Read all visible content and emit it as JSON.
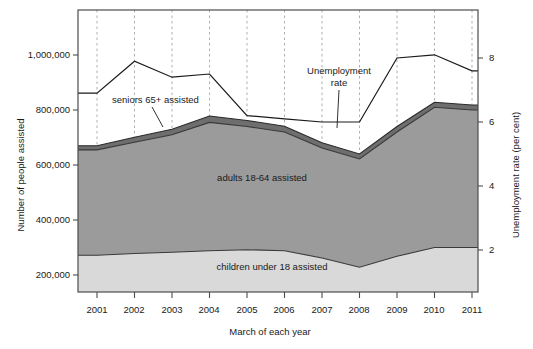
{
  "chart_data": {
    "type": "area",
    "title": "",
    "subtitle": "",
    "xlabel": "March of each year",
    "ylabel": "Number of people assisted",
    "y2label": "Unemployment rate (per cent)",
    "x": [
      2001,
      2002,
      2003,
      2004,
      2005,
      2006,
      2007,
      2008,
      2009,
      2010,
      2011
    ],
    "categories": [
      "2001",
      "2002",
      "2003",
      "2004",
      "2005",
      "2006",
      "2007",
      "2008",
      "2009",
      "2010",
      "2011"
    ],
    "xlim": [
      2000.5,
      2011.5
    ],
    "ylim": [
      0,
      1100000
    ],
    "y2lim": [
      0,
      8.8
    ],
    "yticks": [
      200000,
      400000,
      600000,
      800000,
      1000000
    ],
    "ytick_labels": [
      "200,000",
      "400,000",
      "600,000",
      "800,000",
      "1,000,000"
    ],
    "y2ticks": [
      2,
      4,
      6,
      8
    ],
    "y2tick_labels": [
      "2",
      "4",
      "6",
      "8"
    ],
    "grid": "vertical-dashed",
    "legend_position": "inline-annotations",
    "stacked": true,
    "series": [
      {
        "name": "children under 18 assisted",
        "axis": "left",
        "color": "#d9d9d9",
        "values": [
          272000,
          278000,
          283000,
          288000,
          292000,
          288000,
          262000,
          228000,
          268000,
          300000,
          300000
        ]
      },
      {
        "name": "adults 18-64 assisted",
        "axis": "left",
        "color": "#9b9b9b",
        "values": [
          383000,
          405000,
          427000,
          467000,
          448000,
          432000,
          400000,
          394000,
          452000,
          510000,
          500000
        ]
      },
      {
        "name": "seniors 65+ assisted",
        "axis": "left",
        "color": "#6e6e6e",
        "values": [
          15000,
          18000,
          20000,
          23000,
          22000,
          21000,
          19000,
          18000,
          20000,
          18000,
          18000
        ]
      }
    ],
    "cumulative_totals": {
      "children_top": [
        272000,
        278000,
        283000,
        288000,
        292000,
        288000,
        262000,
        228000,
        268000,
        300000,
        300000
      ],
      "adults_top": [
        655000,
        683000,
        710000,
        755000,
        740000,
        720000,
        662000,
        622000,
        720000,
        810000,
        800000
      ],
      "seniors_top": [
        670000,
        701000,
        730000,
        778000,
        762000,
        741000,
        681000,
        640000,
        740000,
        828000,
        818000
      ]
    },
    "line_series": [
      {
        "name": "Unemployment rate",
        "axis": "right",
        "color": "#1a1a1a",
        "values": [
          6.9,
          7.9,
          7.4,
          7.5,
          6.2,
          6.1,
          6.0,
          6.0,
          8.0,
          8.1,
          7.6
        ]
      }
    ],
    "annotations": [
      {
        "name": "seniors-callout",
        "text": "seniors 65+ assisted"
      },
      {
        "name": "unemployment-callout",
        "text": "Unemployment\nrate"
      },
      {
        "name": "adults-inline",
        "text": "adults 18-64 assisted"
      },
      {
        "name": "children-inline",
        "text": "children under 18 assisted"
      }
    ]
  },
  "labels": {
    "y_axis_title": "Number of people assisted",
    "y2_axis_title": "Unemployment rate (per cent)",
    "x_axis_title": "March of each year",
    "unemployment_line1": "Unemployment",
    "unemployment_line2": "rate",
    "seniors_callout": "seniors 65+ assisted",
    "adults_inline": "adults 18-64 assisted",
    "children_inline": "children under 18 assisted"
  },
  "ytick_labels": {
    "t0": "1,000,000",
    "t1": "800,000",
    "t2": "600,000",
    "t3": "400,000",
    "t4": "200,000"
  },
  "y2tick_labels": {
    "t0": "8",
    "t1": "6",
    "t2": "4",
    "t3": "2"
  },
  "xtick_labels": {
    "t0": "2001",
    "t1": "2002",
    "t2": "2003",
    "t3": "2004",
    "t4": "2005",
    "t5": "2006",
    "t6": "2007",
    "t7": "2008",
    "t8": "2009",
    "t9": "2010",
    "t10": "2011"
  },
  "colors": {
    "children_band": "#d9d9d9",
    "adults_band": "#9b9b9b",
    "seniors_band": "#6e6e6e",
    "line": "#1a1a1a",
    "grid": "#9a9a9a",
    "frame": "#4d4d4d",
    "background": "#ffffff"
  }
}
